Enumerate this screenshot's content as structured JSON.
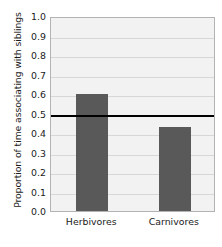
{
  "chart_data": {
    "type": "bar",
    "title": "",
    "xlabel": "",
    "ylabel": "Proportion of time associating with siblings",
    "categories": [
      "Herbivores",
      "Carnivores"
    ],
    "values": [
      0.6,
      0.43
    ],
    "ylim": [
      0.0,
      1.0
    ],
    "ytick_labels": [
      "0.0",
      "0.1",
      "0.2",
      "0.3",
      "0.4",
      "0.5",
      "0.6",
      "0.7",
      "0.8",
      "0.9",
      "1.0"
    ],
    "ytick_values": [
      0.0,
      0.1,
      0.2,
      0.3,
      0.4,
      0.5,
      0.6,
      0.7,
      0.8,
      0.9,
      1.0
    ],
    "grid": true,
    "legend": "none",
    "annotations": [
      {
        "name": "reference-line",
        "value": 0.5,
        "orientation": "horizontal",
        "color": "#000000",
        "label": ""
      }
    ],
    "colors": {
      "bar_fill": "#595959",
      "panel_background": "#f2f2f2",
      "gridline": "#d7d7d7",
      "panel_border": "#b3b3b3",
      "text": "#1a1a1a",
      "reference_line": "#000000"
    }
  }
}
